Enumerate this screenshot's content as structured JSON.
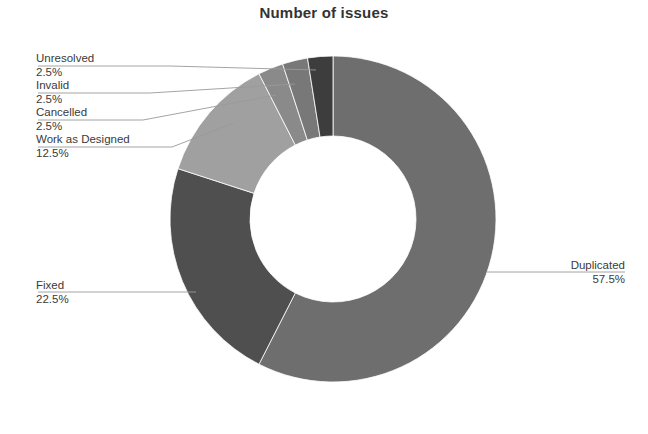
{
  "chart": {
    "title": "Number of issues"
  },
  "chart_data": {
    "type": "pie",
    "variant": "donut",
    "title": "Number of issues",
    "xlabel": "",
    "ylabel": "",
    "legend_position": "none",
    "grid": false,
    "start_angle_deg": 0,
    "direction": "clockwise",
    "inner_radius_ratio": 0.51,
    "categories": [
      "Duplicated",
      "Fixed",
      "Work as Designed",
      "Cancelled",
      "Invalid",
      "Unresolved"
    ],
    "values": [
      57.5,
      22.5,
      12.5,
      2.5,
      2.5,
      2.5
    ],
    "value_labels": [
      "57.5%",
      "22.5%",
      "12.5%",
      "2.5%",
      "2.5%",
      "2.5%"
    ],
    "unit": "%",
    "colors": [
      "#6e6e6e",
      "#4f4f4f",
      "#a0a0a0",
      "#8a8a8a",
      "#787878",
      "#3d3d3d"
    ],
    "slices": [
      {
        "label": "Duplicated",
        "value": 57.5,
        "value_label": "57.5%",
        "color": "#6e6e6e"
      },
      {
        "label": "Fixed",
        "value": 22.5,
        "value_label": "22.5%",
        "color": "#4f4f4f"
      },
      {
        "label": "Work as Designed",
        "value": 12.5,
        "value_label": "12.5%",
        "color": "#a0a0a0"
      },
      {
        "label": "Cancelled",
        "value": 2.5,
        "value_label": "2.5%",
        "color": "#8a8a8a"
      },
      {
        "label": "Invalid",
        "value": 2.5,
        "value_label": "2.5%",
        "color": "#787878"
      },
      {
        "label": "Unresolved",
        "value": 2.5,
        "value_label": "2.5%",
        "color": "#3d3d3d"
      }
    ]
  },
  "callouts": {
    "unresolved": {
      "name": "Unresolved",
      "value": "2.5%"
    },
    "invalid": {
      "name": "Invalid",
      "value": "2.5%"
    },
    "cancelled": {
      "name": "Cancelled",
      "value": "2.5%"
    },
    "work_as_designed": {
      "name": "Work as Designed",
      "value": "12.5%"
    },
    "fixed": {
      "name": "Fixed",
      "value": "22.5%"
    },
    "duplicated": {
      "name": "Duplicated",
      "value": "57.5%"
    }
  }
}
